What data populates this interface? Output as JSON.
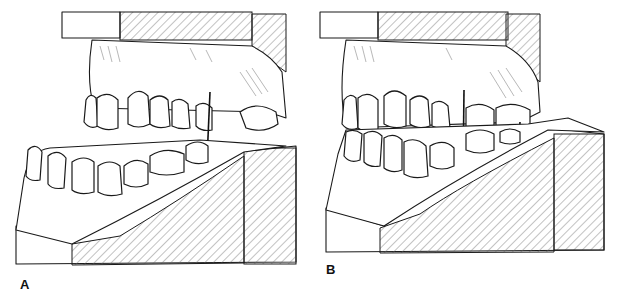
{
  "figure": {
    "panels": [
      {
        "label": "A",
        "description": "Dental casts mounted, open relation with vertical reference line at canine region"
      },
      {
        "label": "B",
        "description": "Dental casts mounted in occlusion with vertical reference lines"
      }
    ]
  },
  "colors": {
    "line": "#1a1a1a",
    "hatch": "#666666",
    "background": "#ffffff"
  }
}
